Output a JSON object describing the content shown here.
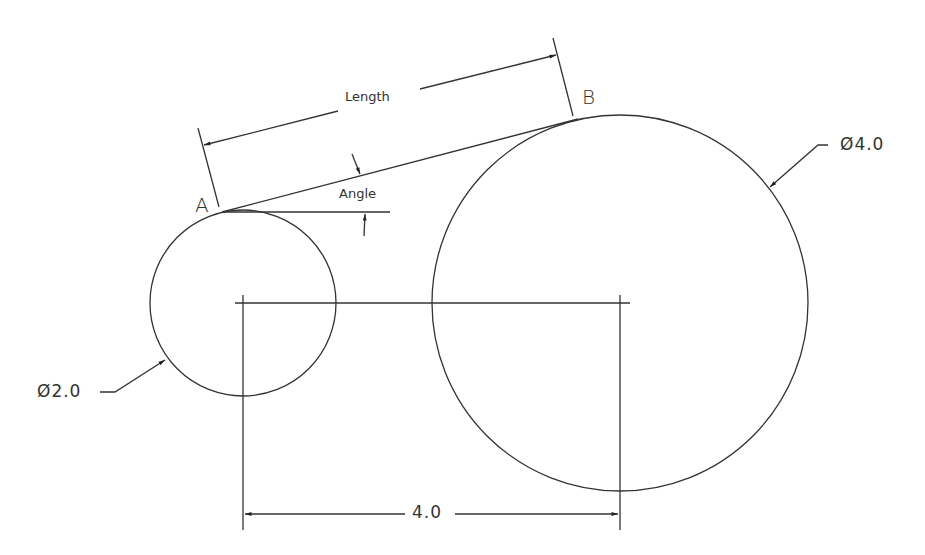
{
  "drawing": {
    "type": "CAD tangent line between two circles",
    "points": {
      "a": "A",
      "b": "B"
    },
    "labels": {
      "length": "Length",
      "angle": "Angle",
      "small_diameter": "Ø2.0",
      "large_diameter": "Ø4.0",
      "center_distance": "4.0"
    },
    "geometry": {
      "small_circle": {
        "cx": 243,
        "cy": 303,
        "r": 93,
        "diameter": 2.0
      },
      "large_circle": {
        "cx": 620,
        "cy": 303,
        "r": 188,
        "diameter": 4.0
      },
      "center_distance": 4.0
    },
    "colors": {
      "line": "#333333",
      "background": "#ffffff"
    }
  }
}
